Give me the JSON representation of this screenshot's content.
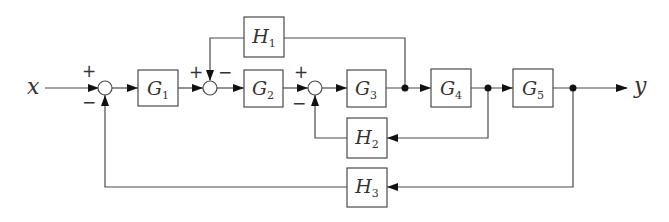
{
  "diagram": {
    "input_label": "x",
    "output_label": "y",
    "blocks": [
      {
        "letter": "G",
        "sub": "1"
      },
      {
        "letter": "G",
        "sub": "2"
      },
      {
        "letter": "G",
        "sub": "3"
      },
      {
        "letter": "G",
        "sub": "4"
      },
      {
        "letter": "G",
        "sub": "5"
      },
      {
        "letter": "H",
        "sub": "1"
      },
      {
        "letter": "H",
        "sub": "2"
      },
      {
        "letter": "H",
        "sub": "3"
      }
    ],
    "junctions": [
      {
        "sign_a": "+",
        "sign_b": "−"
      },
      {
        "sign_a": "+",
        "sign_b": "−"
      },
      {
        "sign_a": "+",
        "sign_b": "−"
      }
    ]
  }
}
